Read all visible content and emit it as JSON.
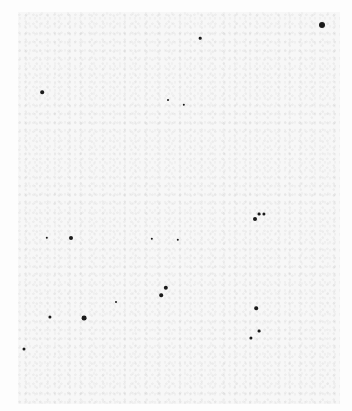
{
  "image": {
    "description": "Inverted (negative) astronomical star field: dark star points on a light speckled background",
    "width": 352,
    "height": 411,
    "background_color": "#f7f7f7",
    "star_color": "#1a1a1a",
    "stars": [
      {
        "x": 322,
        "y": 25,
        "r": 3
      },
      {
        "x": 42,
        "y": 92,
        "r": 1.8
      },
      {
        "x": 200,
        "y": 38,
        "r": 1.3
      },
      {
        "x": 184,
        "y": 105,
        "r": 1.2
      },
      {
        "x": 168,
        "y": 100,
        "r": 1
      },
      {
        "x": 71,
        "y": 238,
        "r": 2
      },
      {
        "x": 47,
        "y": 238,
        "r": 1.2
      },
      {
        "x": 255,
        "y": 219,
        "r": 2
      },
      {
        "x": 259,
        "y": 214,
        "r": 1.4
      },
      {
        "x": 264,
        "y": 214,
        "r": 1.6
      },
      {
        "x": 166,
        "y": 288,
        "r": 2.2
      },
      {
        "x": 161,
        "y": 295,
        "r": 1.8
      },
      {
        "x": 84,
        "y": 318,
        "r": 2.4
      },
      {
        "x": 50,
        "y": 317,
        "r": 1.6
      },
      {
        "x": 24,
        "y": 349,
        "r": 1.5
      },
      {
        "x": 256,
        "y": 308,
        "r": 1.8
      },
      {
        "x": 259,
        "y": 331,
        "r": 1.4
      },
      {
        "x": 251,
        "y": 338,
        "r": 1.6
      },
      {
        "x": 152,
        "y": 239,
        "r": 1.2
      },
      {
        "x": 116,
        "y": 302,
        "r": 1
      },
      {
        "x": 178,
        "y": 240,
        "r": 1.2
      }
    ]
  }
}
